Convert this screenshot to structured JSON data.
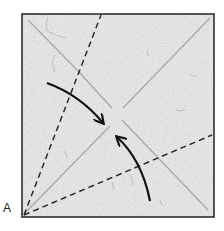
{
  "diagram": {
    "type": "origami-fold-diagram",
    "corner_label": "A",
    "colors": {
      "paper": "#e6e6e4",
      "outline": "#222222",
      "crease": "#a9a9a9",
      "valley_fold": "#222222",
      "arrow": "#111111"
    },
    "elements": {
      "square": {
        "x": 22,
        "y": 14,
        "w": 192,
        "h": 203
      },
      "diagonals": "two light crease diagonals crossing at center",
      "valley_folds": "two dashed lines radiating from corner A",
      "arrows": "two curved arrows pointing toward the center"
    }
  }
}
